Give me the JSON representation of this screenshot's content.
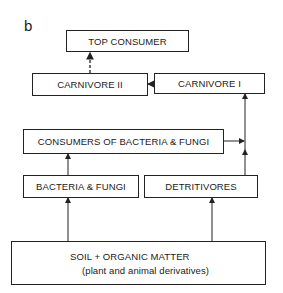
{
  "panel_label": "b",
  "nodes": {
    "top_consumer": "TOP CONSUMER",
    "carnivore_ii": "CARNIVORE II",
    "carnivore_i": "CARNIVORE I",
    "consumers": "CONSUMERS OF BACTERIA & FUNGI",
    "bacteria_fungi": "BACTERIA & FUNGI",
    "detritivores": "DETRITIVORES",
    "soil_line1": "SOIL + ORGANIC MATTER",
    "soil_line2": "(plant and animal derivatives)"
  },
  "edges": [
    {
      "from": "soil",
      "to": "bacteria_fungi",
      "style": "solid"
    },
    {
      "from": "soil",
      "to": "detritivores",
      "style": "solid"
    },
    {
      "from": "bacteria_fungi",
      "to": "consumers",
      "style": "solid"
    },
    {
      "from": "detritivores",
      "to": "carnivore_i",
      "style": "solid"
    },
    {
      "from": "consumers",
      "to": "carnivore_i",
      "style": "solid"
    },
    {
      "from": "carnivore_i",
      "to": "carnivore_ii",
      "style": "solid"
    },
    {
      "from": "carnivore_ii",
      "to": "top_consumer",
      "style": "dashed"
    }
  ]
}
